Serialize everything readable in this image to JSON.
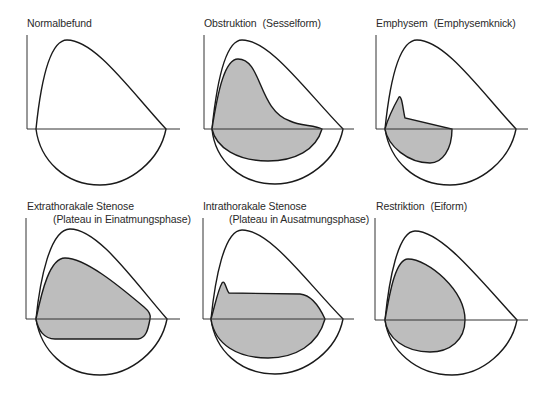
{
  "diagram": {
    "type": "flow-volume-loops",
    "fill_color": "#bdbdbd",
    "line_color": "#1a1a1a",
    "panels": [
      {
        "title": "Normalbefund",
        "subtitle": ""
      },
      {
        "title": "Obstruktion",
        "subtitle": "(Sesselform)"
      },
      {
        "title": "Emphysem",
        "subtitle": "(Emphysemknick)"
      },
      {
        "title": "Extrathorakale Stenose",
        "subtitle": "(Plateau in Einatmungsphase)"
      },
      {
        "title": "Intrathorakale Stenose",
        "subtitle": "(Plateau in Ausatmungsphase)"
      },
      {
        "title": "Restriktion",
        "subtitle": "(Eiform)"
      }
    ]
  }
}
